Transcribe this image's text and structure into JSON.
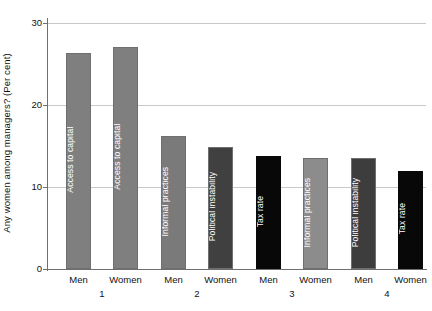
{
  "chart_data": {
    "type": "bar",
    "title": "",
    "xlabel": "",
    "ylabel": "Any women among managers? (Per cent)",
    "ylim": [
      0,
      31
    ],
    "yticks": [
      0,
      10,
      20,
      30
    ],
    "ytick_labels": [
      "0",
      "10",
      "20",
      "30"
    ],
    "grid": true,
    "legend": "none",
    "categories": [
      "Men",
      "Women",
      "Men",
      "Women",
      "Men",
      "Women",
      "Men",
      "Women"
    ],
    "group_labels": [
      "1",
      "2",
      "3",
      "4"
    ],
    "values": [
      26.4,
      27.1,
      16.2,
      14.9,
      13.8,
      13.5,
      13.5,
      12.0
    ],
    "bar_labels": [
      "Access to capital",
      "Access to capital",
      "Informal practices",
      "Political instability",
      "Tax rate",
      "Informal practices",
      "Political instability",
      "Tax rate"
    ],
    "bar_colors": [
      "#7f7f7f",
      "#7f7f7f",
      "#7a7a7a",
      "#404040",
      "#080808",
      "#8c8c8c",
      "#3d3d3d",
      "#080808"
    ],
    "bars": [
      {
        "group": "1",
        "sex": "Men",
        "value": 26.4,
        "label": "Access to capital",
        "color": "#7f7f7f"
      },
      {
        "group": "1",
        "sex": "Women",
        "value": 27.1,
        "label": "Access to capital",
        "color": "#7f7f7f"
      },
      {
        "group": "2",
        "sex": "Men",
        "value": 16.2,
        "label": "Informal practices",
        "color": "#7a7a7a"
      },
      {
        "group": "2",
        "sex": "Women",
        "value": 14.9,
        "label": "Political instability",
        "color": "#404040"
      },
      {
        "group": "3",
        "sex": "Men",
        "value": 13.8,
        "label": "Tax rate",
        "color": "#080808"
      },
      {
        "group": "3",
        "sex": "Women",
        "value": 13.5,
        "label": "Informal practices",
        "color": "#8c8c8c"
      },
      {
        "group": "4",
        "sex": "Men",
        "value": 13.5,
        "label": "Political instability",
        "color": "#3d3d3d"
      },
      {
        "group": "4",
        "sex": "Women",
        "value": 12.0,
        "label": "Tax rate",
        "color": "#080808"
      }
    ],
    "axis_color": "#6f6f6f",
    "grid_color": "#c9c9c9",
    "background": "#ffffff"
  }
}
